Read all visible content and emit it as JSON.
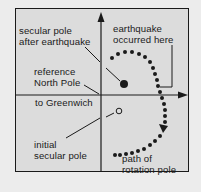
{
  "diagram": {
    "type": "polar-motion-diagram",
    "colors": {
      "page_background": "#ececec",
      "frame_background": "#dcdcdc",
      "ink": "#1a1a1a"
    },
    "axes": {
      "vertical": {
        "direction": "up",
        "arrow": true
      },
      "horizontal": {
        "direction": "right",
        "arrow": true
      }
    },
    "labels": {
      "secular_pole_after": "secular pole\nafter earthquake",
      "earthquake_here": "earthquake\noccurred here",
      "reference_north_pole": "reference\nNorth Pole",
      "to_greenwich": "to Greenwich",
      "initial_secular_pole": "initial\nsecular pole",
      "path_of_rotation_pole": "path of\nrotation pole"
    },
    "markers": {
      "secular_pole_after": "filled-circle",
      "initial_secular_pole": "open-circle",
      "rotation_path": "dotted-arc-with-arrowheads"
    }
  }
}
